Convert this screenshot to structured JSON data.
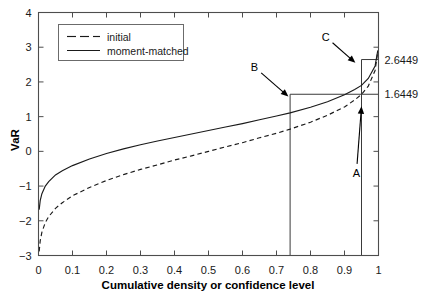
{
  "chart_data": {
    "type": "line",
    "title": "",
    "xlabel": "Cumulative density or confidence level",
    "ylabel": "VaR",
    "xlim": [
      0,
      1
    ],
    "ylim": [
      -3,
      4
    ],
    "grid": false,
    "legend_position": "top-left",
    "xticks": [
      "0",
      "0.1",
      "0.2",
      "0.3",
      "0.4",
      "0.5",
      "0.6",
      "0.7",
      "0.8",
      "0.9",
      "1"
    ],
    "xtick_values": [
      0,
      0.1,
      0.2,
      0.3,
      0.4,
      0.5,
      0.6,
      0.7,
      0.8,
      0.9,
      1
    ],
    "yticks": [
      "4",
      "3",
      "2",
      "1",
      "0",
      "−1",
      "−2",
      "−3"
    ],
    "ytick_values": [
      4,
      3,
      2,
      1,
      0,
      -1,
      -2,
      -3
    ],
    "series": [
      {
        "name": "initial",
        "style": "dashed",
        "color": "#1a1a1a",
        "x": [
          0.002,
          0.005,
          0.01,
          0.02,
          0.03,
          0.05,
          0.07,
          0.1,
          0.15,
          0.2,
          0.25,
          0.3,
          0.35,
          0.4,
          0.45,
          0.5,
          0.55,
          0.6,
          0.65,
          0.7,
          0.74,
          0.8,
          0.85,
          0.9,
          0.93,
          0.95,
          0.97,
          0.99,
          0.998
        ],
        "y": [
          -2.88,
          -2.58,
          -2.33,
          -2.05,
          -1.88,
          -1.64,
          -1.48,
          -1.28,
          -1.04,
          -0.84,
          -0.67,
          -0.52,
          -0.39,
          -0.25,
          -0.13,
          0.0,
          0.13,
          0.25,
          0.39,
          0.52,
          0.64,
          0.84,
          1.04,
          1.28,
          1.48,
          1.64,
          1.88,
          2.33,
          2.88
        ]
      },
      {
        "name": "moment-matched",
        "style": "solid",
        "color": "#1a1a1a",
        "x": [
          0.002,
          0.005,
          0.01,
          0.02,
          0.03,
          0.05,
          0.07,
          0.1,
          0.15,
          0.2,
          0.25,
          0.3,
          0.35,
          0.4,
          0.45,
          0.5,
          0.55,
          0.6,
          0.65,
          0.7,
          0.74,
          0.8,
          0.85,
          0.9,
          0.93,
          0.95,
          0.97,
          0.99,
          0.998
        ],
        "y": [
          -1.68,
          -1.42,
          -1.22,
          -1.0,
          -0.87,
          -0.68,
          -0.56,
          -0.41,
          -0.22,
          -0.06,
          0.07,
          0.19,
          0.3,
          0.4,
          0.5,
          0.6,
          0.7,
          0.8,
          0.91,
          1.02,
          1.11,
          1.27,
          1.43,
          1.63,
          1.78,
          1.9,
          2.1,
          2.46,
          2.91
        ]
      }
    ],
    "reference_values": [
      {
        "label": "2.6449",
        "y": 2.6449,
        "from_x": 0.95,
        "to_x": 1.0
      },
      {
        "label": "1.6449",
        "y": 1.6449,
        "from_x": 0.74,
        "to_x": 1.0
      }
    ],
    "vertical_markers": [
      {
        "x": 0.74,
        "from_y": -3,
        "to_y": 1.6449
      },
      {
        "x": 0.95,
        "from_y": -3,
        "to_y": 2.6449
      }
    ],
    "annotations": [
      {
        "label": "A",
        "label_x": 0.935,
        "label_y": -0.62,
        "tip_x": 0.95,
        "tip_y": 1.3
      },
      {
        "label": "B",
        "label_x": 0.635,
        "label_y": 2.43,
        "tip_x": 0.735,
        "tip_y": 1.58
      },
      {
        "label": "C",
        "label_x": 0.845,
        "label_y": 3.3,
        "tip_x": 0.932,
        "tip_y": 2.55
      }
    ]
  },
  "legend": {
    "entries": [
      {
        "label": "initial",
        "style": "dashed"
      },
      {
        "label": "moment-matched",
        "style": "solid"
      }
    ]
  }
}
